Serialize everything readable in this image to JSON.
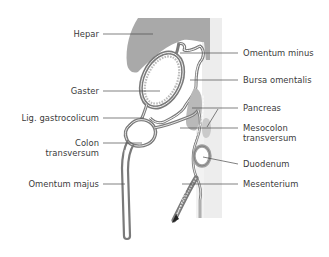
{
  "figure": {
    "colors": {
      "organ_fill": "#a9a9a9",
      "organ_outline": "#7a7a7a",
      "background_panel": "#ececec",
      "pancreas_fill": "#c4c4c4",
      "leader_line": "#4a4a4a",
      "text": "#3a3a3a"
    },
    "labels_left": [
      {
        "id": "hepar",
        "text": "Hepar"
      },
      {
        "id": "gaster",
        "text": "Gaster"
      },
      {
        "id": "lig-gastrocolicum",
        "text": "Lig. gastrocolicum"
      },
      {
        "id": "colon-transversum",
        "line1": "Colon",
        "line2": "transversum"
      },
      {
        "id": "omentum-majus",
        "text": "Omentum majus"
      }
    ],
    "labels_right": [
      {
        "id": "omentum-minus",
        "text": "Omentum minus"
      },
      {
        "id": "bursa-omentalis",
        "text": "Bursa omentalis"
      },
      {
        "id": "pancreas",
        "text": "Pancreas"
      },
      {
        "id": "mesocolon-transversum",
        "line1": "Mesocolon",
        "line2": "transversum"
      },
      {
        "id": "duodenum",
        "text": "Duodenum"
      },
      {
        "id": "mesenterium",
        "text": "Mesenterium"
      }
    ]
  }
}
